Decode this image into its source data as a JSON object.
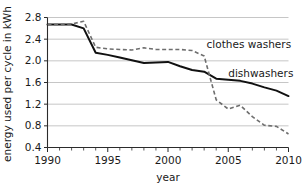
{
  "chart_data": {
    "type": "line",
    "title": "",
    "xlabel": "year",
    "ylabel": "energy used per cycle in kWh",
    "xlim": [
      1990,
      2010
    ],
    "ylim": [
      0.4,
      2.8
    ],
    "grid": true,
    "legend_position": "inline-annotation",
    "x_ticks": [
      1990,
      1995,
      2000,
      2005,
      2010
    ],
    "x_tick_labels": [
      "1990",
      "1995",
      "2000",
      "2005",
      "2010"
    ],
    "x_minor_tick_step": 1,
    "y_ticks": [
      0.4,
      0.8,
      1.2,
      1.6,
      2.0,
      2.4,
      2.8
    ],
    "y_tick_labels": [
      "0.4",
      "0.8",
      "1.2",
      "1.6",
      "2.0",
      "2.4",
      "2.8"
    ],
    "x": [
      1990,
      1991,
      1992,
      1993,
      1994,
      1995,
      1996,
      1997,
      1998,
      1999,
      2000,
      2001,
      2002,
      2003,
      2004,
      2005,
      2006,
      2007,
      2008,
      2009,
      2010
    ],
    "series": [
      {
        "name": "dishwashers",
        "style": "solid",
        "color": "#111111",
        "values": [
          2.67,
          2.67,
          2.67,
          2.6,
          2.15,
          2.11,
          2.06,
          2.01,
          1.96,
          1.97,
          1.98,
          1.9,
          1.83,
          1.8,
          1.67,
          1.65,
          1.63,
          1.58,
          1.51,
          1.45,
          1.35
        ]
      },
      {
        "name": "clothes washers",
        "style": "dashed",
        "color": "#6e6e6e",
        "values": [
          2.67,
          2.67,
          2.68,
          2.73,
          2.25,
          2.22,
          2.21,
          2.2,
          2.24,
          2.21,
          2.21,
          2.21,
          2.19,
          2.09,
          1.28,
          1.11,
          1.18,
          0.97,
          0.81,
          0.79,
          0.65
        ]
      }
    ],
    "annotations": [
      {
        "text": "clothes washers",
        "x": 2003.2,
        "y": 2.31
      },
      {
        "text": "dishwashers",
        "x": 2005.0,
        "y": 1.77
      }
    ]
  }
}
